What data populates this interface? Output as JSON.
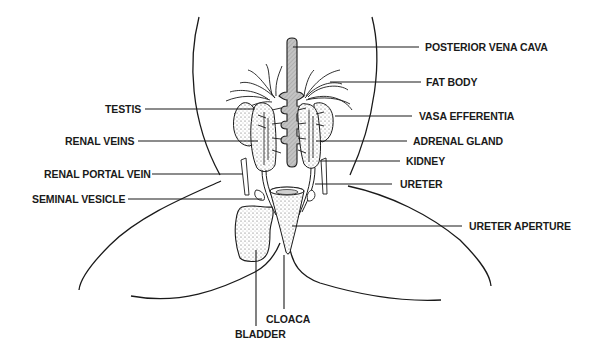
{
  "diagram": {
    "labels": {
      "posterior_vena_cava": "POSTERIOR VENA CAVA",
      "fat_body": "FAT BODY",
      "vasa_efferentia": "VASA EFFERENTIA",
      "adrenal_gland": "ADRENAL GLAND",
      "kidney": "KIDNEY",
      "ureter": "URETER",
      "ureter_aperture": "URETER APERTURE",
      "testis": "TESTIS",
      "renal_veins": "RENAL VEINS",
      "renal_portal_vein": "RENAL PORTAL VEIN",
      "seminal_vesicle": "SEMINAL VESICLE",
      "cloaca": "CLOACA",
      "bladder": "BLADDER"
    },
    "colors": {
      "line": "#1a1a1a",
      "vena_cava_fill": "#b8b8b8",
      "organ_stipple": "#e6e6e6",
      "background": "#ffffff"
    }
  }
}
